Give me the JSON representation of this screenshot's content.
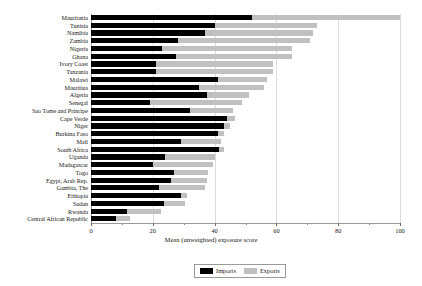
{
  "chart_data": {
    "type": "bar",
    "orientation": "horizontal",
    "stacked": true,
    "title": "",
    "xlabel": "Mean (unweighted) exposure score",
    "ylabel": "",
    "xlim": [
      0,
      100
    ],
    "xticks": [
      0,
      20,
      40,
      60,
      80,
      100
    ],
    "xticklabels": [
      "0",
      "20",
      "40",
      "60",
      "80",
      "100"
    ],
    "grid": true,
    "grid_axis": "x",
    "legend_position": "bottom-center",
    "categories": [
      "Mauritania",
      "Tunisia",
      "Namibia",
      "Zambia",
      "Nigeria",
      "Ghana",
      "Ivory Coast",
      "Tanzania",
      "Malawi",
      "Mauritius",
      "Algeria",
      "Senegal",
      "Sao Tome and Principe",
      "Cape Verde",
      "Niger",
      "Burkina Faso",
      "Mali",
      "South Africa",
      "Uganda",
      "Madagascar",
      "Togo",
      "Egypt, Arab Rep.",
      "Gambia, The",
      "Ethiopia",
      "Sudan",
      "Rwanda",
      "Central African Republic"
    ],
    "series": [
      {
        "name": "Imports",
        "color": "#000000",
        "values": [
          52,
          40,
          37,
          28,
          23,
          27.5,
          21,
          21,
          41,
          35,
          37.5,
          19,
          32,
          44,
          43,
          41,
          29,
          41.5,
          24,
          20,
          27,
          26,
          22,
          29,
          23.5,
          11.5,
          8
        ]
      },
      {
        "name": "Exports",
        "color": "#c0c0c0",
        "values": [
          48,
          33,
          35,
          43,
          42,
          37.5,
          38,
          38,
          16,
          21,
          13.5,
          30,
          14,
          2.5,
          2,
          2,
          13,
          1.5,
          16,
          19.5,
          11,
          11.5,
          15,
          2,
          7,
          11,
          4.5
        ]
      }
    ],
    "totals": [
      100,
      73,
      72,
      71,
      65,
      65,
      59,
      59,
      57,
      56,
      51,
      49,
      46,
      46.5,
      45,
      43,
      42,
      43,
      40,
      39.5,
      38,
      37.5,
      37,
      31,
      30.5,
      22.5,
      12.5
    ]
  },
  "legend": {
    "items": [
      {
        "label": "Imports",
        "color": "#000000"
      },
      {
        "label": "Exports",
        "color": "#c0c0c0"
      }
    ]
  }
}
